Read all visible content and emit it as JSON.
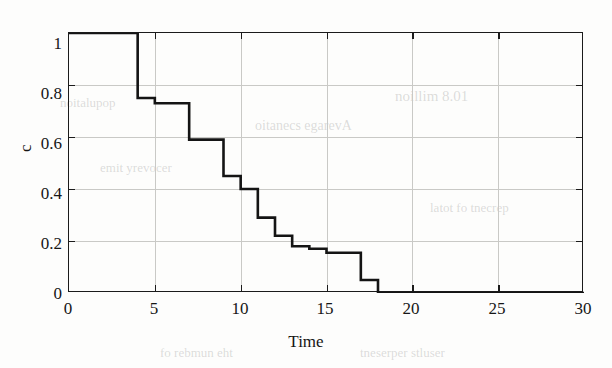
{
  "figure": {
    "y_axis_label": "c",
    "x_axis_label": "Time",
    "y_ticks": [
      "0",
      "0.2",
      "0.4",
      "0.6",
      "0.8",
      "1"
    ],
    "x_ticks": [
      "0",
      "5",
      "10",
      "15",
      "20",
      "25",
      "30"
    ],
    "line_color": "#141414",
    "grid_color": "#c9c9c6",
    "axis_color": "#1b1b1b",
    "background_color": "#fdfdfc"
  },
  "background_text": {
    "items": [
      "noillim 8.01",
      "oitanecs egarevA",
      "emit yrevocer",
      "noitalupop",
      "latot fo tnecrep",
      "fo rebmun eht",
      "tneserper stluser"
    ]
  },
  "chart_data": {
    "type": "line",
    "subtype": "step-post",
    "title": "",
    "xlabel": "Time",
    "ylabel": "c",
    "xlim": [
      0,
      30
    ],
    "ylim": [
      0,
      1
    ],
    "xticks": [
      0,
      5,
      10,
      15,
      20,
      25,
      30
    ],
    "yticks": [
      0,
      0.2,
      0.4,
      0.6,
      0.8,
      1
    ],
    "grid": true,
    "legend": null,
    "series": [
      {
        "name": "c",
        "x": [
          0,
          4,
          5,
          7,
          9,
          10,
          11,
          12,
          13,
          14,
          15,
          17,
          18,
          30
        ],
        "y": [
          1.0,
          0.75,
          0.73,
          0.59,
          0.45,
          0.4,
          0.29,
          0.22,
          0.18,
          0.17,
          0.155,
          0.05,
          0.0,
          0.0
        ]
      }
    ]
  }
}
